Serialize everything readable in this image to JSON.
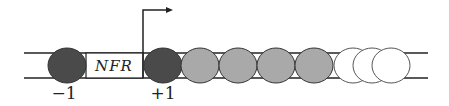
{
  "diagram": {
    "nfr_label": "NFR",
    "labels": {
      "minus_one": "−1",
      "plus_one": "+1"
    },
    "colors": {
      "dark_nucleosome": "#4a4a4a",
      "gray_nucleosome": "#a9a9a9",
      "white_nucleosome": "#ffffff",
      "line": "#222222"
    },
    "nucleosomes": [
      {
        "id": "minus-1",
        "cx": 67,
        "type": "dark"
      },
      {
        "id": "plus-1",
        "cx": 163,
        "type": "dark"
      },
      {
        "id": "plus-2",
        "cx": 200,
        "type": "gray"
      },
      {
        "id": "plus-3",
        "cx": 238,
        "type": "gray"
      },
      {
        "id": "plus-4",
        "cx": 276,
        "type": "gray"
      },
      {
        "id": "plus-5",
        "cx": 314,
        "type": "gray"
      },
      {
        "id": "plus-6",
        "cx": 353,
        "type": "white"
      },
      {
        "id": "plus-7",
        "cx": 372,
        "type": "white"
      },
      {
        "id": "plus-8",
        "cx": 391,
        "type": "white"
      }
    ]
  }
}
